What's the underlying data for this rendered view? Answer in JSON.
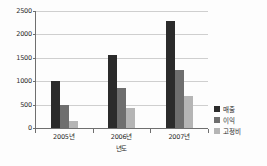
{
  "chart_data": {
    "type": "bar",
    "title": "",
    "xlabel": "년도",
    "ylabel": "",
    "categories": [
      "2005년",
      "2006년",
      "2007년"
    ],
    "series": [
      {
        "name": "매출",
        "color": "#2b2b2b",
        "values": [
          1000,
          1550,
          2280
        ]
      },
      {
        "name": "이익",
        "color": "#6e6e6e",
        "values": [
          500,
          850,
          1250
        ]
      },
      {
        "name": "고정비",
        "color": "#b5b5b5",
        "values": [
          150,
          420,
          680
        ]
      }
    ],
    "ylim": [
      0,
      2500
    ],
    "y_ticks": [
      0,
      500,
      1000,
      1500,
      2000,
      2500
    ],
    "y_tick_labels": [
      "0",
      "500",
      "1000",
      "1500",
      "2000",
      "2500"
    ],
    "grid": true,
    "legend_position": "right"
  }
}
